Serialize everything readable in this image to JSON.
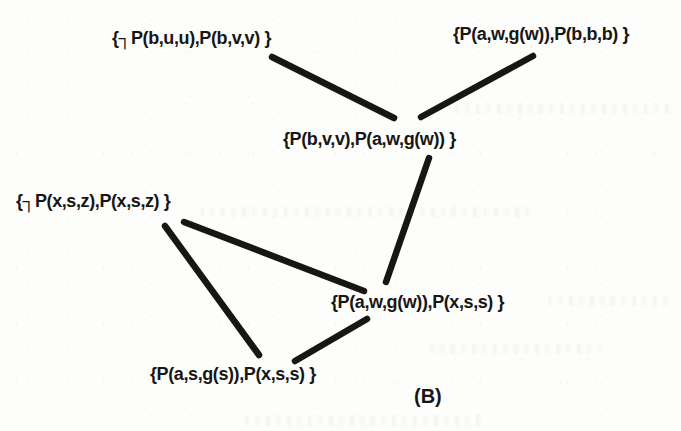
{
  "figure": {
    "caption": "(B)"
  },
  "colors": {
    "ink": "#171614",
    "paper": "#fdfdfb"
  },
  "nodes": {
    "top_left": {
      "label": "{┐P(b,u,u),P(b,v,v) }"
    },
    "top_right": {
      "label": "{P(a,w,g(w)),P(b,b,b) }"
    },
    "middle": {
      "label": "{P(b,v,v),P(a,w,g(w)) }"
    },
    "left": {
      "label": "{┐P(x,s,z),P(x,s,z) }"
    },
    "mid_right": {
      "label": "{P(a,w,g(w)),P(x,s,s) }"
    },
    "bottom": {
      "label": "{P(a,s,g(s)),P(x,s,s) }"
    }
  },
  "edges": [
    {
      "from": "top_left",
      "to": "middle"
    },
    {
      "from": "top_right",
      "to": "middle"
    },
    {
      "from": "middle",
      "to": "mid_right"
    },
    {
      "from": "left",
      "to": "mid_right"
    },
    {
      "from": "left",
      "to": "bottom"
    },
    {
      "from": "bottom",
      "to": "mid_right"
    }
  ]
}
